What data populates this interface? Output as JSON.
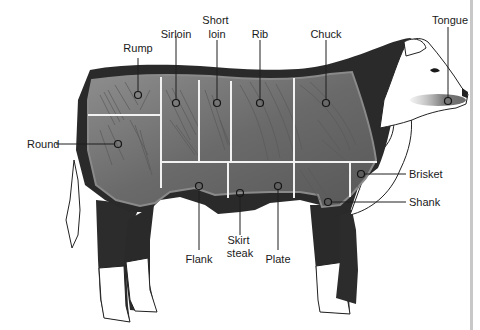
{
  "colors": {
    "hide_dark": "#2a2a2a",
    "meat_gray": "#7c7c7c",
    "cut_lines": "#f2f2f2",
    "tongue_shade": "#8a8a8a",
    "background": "#ffffff",
    "edge_bar": "#c8c8c8"
  },
  "cuts": [
    {
      "id": "rump",
      "label": "Rump",
      "label_lines": [
        "Rump"
      ],
      "marker": [
        138,
        95
      ]
    },
    {
      "id": "sirloin",
      "label": "Sirloin",
      "label_lines": [
        "Sirloin"
      ],
      "marker": [
        176,
        103
      ]
    },
    {
      "id": "short-loin",
      "label": "Short loin",
      "label_lines": [
        "Short",
        "loin"
      ],
      "marker": [
        217,
        103
      ]
    },
    {
      "id": "rib",
      "label": "Rib",
      "label_lines": [
        "Rib"
      ],
      "marker": [
        260,
        103
      ]
    },
    {
      "id": "chuck",
      "label": "Chuck",
      "label_lines": [
        "Chuck"
      ],
      "marker": [
        326,
        103
      ]
    },
    {
      "id": "tongue",
      "label": "Tongue",
      "label_lines": [
        "Tongue"
      ],
      "marker": [
        448,
        101
      ]
    },
    {
      "id": "round",
      "label": "Round",
      "label_lines": [
        "Round"
      ],
      "marker": [
        118,
        144
      ]
    },
    {
      "id": "brisket",
      "label": "Brisket",
      "label_lines": [
        "Brisket"
      ],
      "marker": [
        361,
        174
      ]
    },
    {
      "id": "shank",
      "label": "Shank",
      "label_lines": [
        "Shank"
      ],
      "marker": [
        328,
        202
      ]
    },
    {
      "id": "flank",
      "label": "Flank",
      "label_lines": [
        "Flank"
      ],
      "marker": [
        199,
        186
      ]
    },
    {
      "id": "skirt-steak",
      "label": "Skirt steak",
      "label_lines": [
        "Skirt",
        "steak"
      ],
      "marker": [
        240,
        193
      ]
    },
    {
      "id": "plate",
      "label": "Plate",
      "label_lines": [
        "Plate"
      ],
      "marker": [
        278,
        186
      ]
    }
  ]
}
